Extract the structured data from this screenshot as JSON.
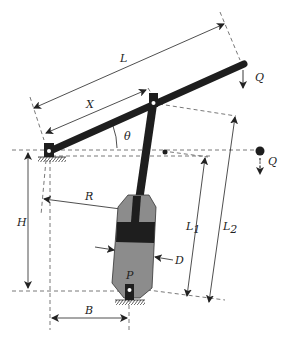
{
  "diagram": {
    "type": "mechanism-schematic",
    "colors": {
      "beam": "#1e1e1e",
      "cylinder_body": "#8c8c8c",
      "piston": "#1e1e1e",
      "dimension_lines": "#333333",
      "dashed_lines": "#555555"
    },
    "labels": {
      "L": "L",
      "X": "X",
      "theta": "θ",
      "Q_top": "Q",
      "Q_right": "Q",
      "H": "H",
      "R": "R",
      "L1": "L",
      "L1_sub": "1",
      "L2": "L",
      "L2_sub": "2",
      "D": "D",
      "P": "P",
      "B": "B"
    }
  }
}
